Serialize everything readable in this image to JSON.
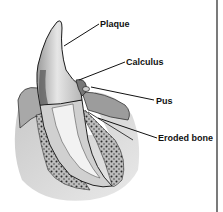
{
  "diagram": {
    "labels": [
      {
        "id": "plaque",
        "text": "Plaque"
      },
      {
        "id": "calculus",
        "text": "Calculus"
      },
      {
        "id": "pus",
        "text": "Pus"
      },
      {
        "id": "eroded-bone",
        "text": "Eroded bone"
      }
    ],
    "colors": {
      "background": "#ffffff",
      "outline": "#1a1a1a",
      "enamel": "#e8e8e8",
      "gum": "#9a9a9a",
      "bone": "#c8c8c8",
      "bone_dots": "#333333",
      "border": "#222222"
    }
  }
}
